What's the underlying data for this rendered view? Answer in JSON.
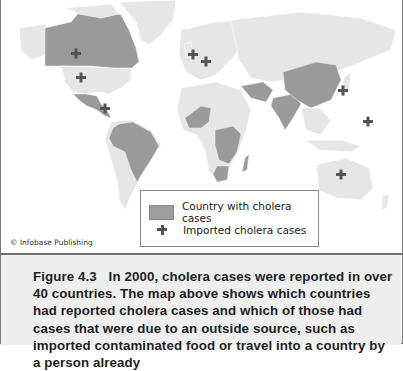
{
  "figure": {
    "credit": "© Infobase Publishing",
    "legend": {
      "items": [
        {
          "symbol": "gray-fill-swatch",
          "label": "Country with cholera cases",
          "color": "#9d9d9d"
        },
        {
          "symbol": "plus-icon",
          "label": "Imported cholera cases",
          "color": "#555555"
        }
      ]
    },
    "caption": {
      "label": "Figure 4.3",
      "text": "In 2000, cholera cases were reported in over 40 countries. The map above shows which countries had reported cholera cases and which of those had cases that were due to an outside source, such as imported contaminated food or travel into a country by a person already"
    },
    "colors": {
      "land": "#e6e6e6",
      "cholera_country": "#9a9a9a",
      "imported_marker": "#555555",
      "caption_background": "#eeeeee"
    },
    "imported_case_locations": [
      "Canada",
      "United States",
      "Central America",
      "United Kingdom",
      "Germany",
      "Japan",
      "Pacific Islands",
      "Australia"
    ],
    "cholera_regions": [
      "Canada",
      "Mexico",
      "Central America",
      "Brazil / South America",
      "West Africa",
      "East Africa",
      "Southern Africa",
      "Madagascar",
      "Middle East",
      "India",
      "China",
      "Southeast Asia"
    ]
  }
}
